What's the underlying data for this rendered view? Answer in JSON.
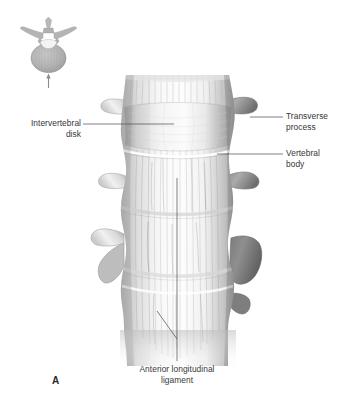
{
  "figure": {
    "letter": "A",
    "view": "anterior view of lumbar vertebral column",
    "background_color": "#ffffff",
    "ink_color": "#363636",
    "leader_color": "#5a5a6a"
  },
  "inset": {
    "name": "orientation-inset",
    "description": "superior view of a lumbar vertebra with an upward arrow indicating the anterior direction of view",
    "arrow_direction": "up"
  },
  "labels": {
    "intervertebral_disk": "Intervertebral\ndisk",
    "transverse_process": "Transverse\nprocess",
    "vertebral_body": "Vertebral\nbody",
    "anterior_longitudinal_ligament": "Anterior longitudinal\nligament"
  },
  "leaders": [
    {
      "name": "leader-intervertebral-disk",
      "from": [
        83,
        124
      ],
      "to": [
        174,
        124
      ]
    },
    {
      "name": "leader-transverse-process",
      "from": [
        283,
        117
      ],
      "to": [
        250,
        117
      ]
    },
    {
      "name": "leader-vertebral-body",
      "from": [
        283,
        154
      ],
      "to": [
        217,
        154
      ]
    },
    {
      "name": "leader-anterior-longitudinal-ligament-vertical",
      "from": [
        177,
        178
      ],
      "to": [
        177,
        361
      ]
    },
    {
      "name": "leader-anterior-longitudinal-ligament-diagonal",
      "from": [
        157,
        311
      ],
      "to": [
        177,
        339
      ]
    }
  ],
  "anatomy": {
    "vertebrae_count": 4,
    "structures": [
      "vertebral body",
      "intervertebral disk",
      "transverse process",
      "anterior longitudinal ligament"
    ]
  }
}
